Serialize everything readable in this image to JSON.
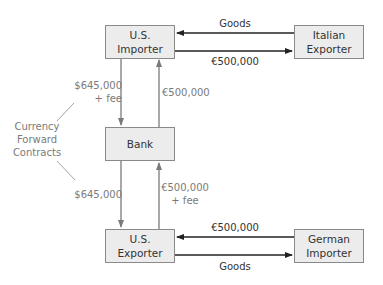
{
  "nodes": {
    "us_importer": "U.S.\nImporter",
    "italian_exporter": "Italian\nExporter",
    "bank": "Bank",
    "us_exporter": "U.S.\nExporter",
    "german_importer": "German\nImporter"
  },
  "flows": {
    "top_goods": "Goods",
    "top_payment": "€500,000",
    "importer_to_bank": "$645,000\n+ fee",
    "bank_to_importer": "€500,000",
    "bank_to_exporter": "$645,000",
    "exporter_to_bank": "€500,000\n+ fee",
    "bottom_payment": "€500,000",
    "bottom_goods": "Goods"
  },
  "annotation": {
    "label": "Currency\nForward\nContracts"
  },
  "colors": {
    "box_fill": "#ececec",
    "box_border": "#8a8a8a",
    "horizontal_arrow": "#222222",
    "vertical_arrow": "#7a7a7a",
    "gray_text": "#7a7a7a"
  }
}
